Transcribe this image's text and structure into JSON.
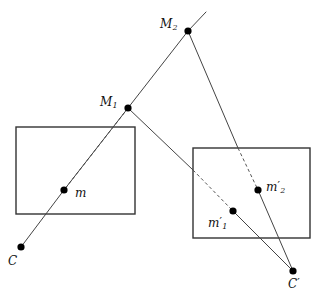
{
  "figure": {
    "type": "geometric-diagram",
    "width": 324,
    "height": 303,
    "background_color": "#ffffff",
    "stroke_color": "#333333",
    "point_color": "#000000",
    "text_color": "#111111"
  },
  "labels": {
    "M1": {
      "base": "M",
      "sub": "1",
      "prime": "",
      "x": 100,
      "y": 96
    },
    "M2": {
      "base": "M",
      "sub": "2",
      "prime": "",
      "x": 160,
      "y": 18
    },
    "m": {
      "base": "m",
      "sub": "",
      "prime": "",
      "x": 75,
      "y": 187
    },
    "m1p": {
      "base": "m",
      "sub": "1",
      "prime": "′",
      "x": 208,
      "y": 216
    },
    "m2p": {
      "base": "m",
      "sub": "2",
      "prime": "′",
      "x": 266,
      "y": 180
    },
    "C": {
      "base": "C",
      "sub": "",
      "prime": "",
      "x": 8,
      "y": 255
    },
    "Cp": {
      "base": "C",
      "sub": "",
      "prime": "′",
      "x": 288,
      "y": 277
    }
  },
  "points": [
    {
      "name": "M1",
      "x": 128,
      "y": 108,
      "r": 3.6
    },
    {
      "name": "M2",
      "x": 188,
      "y": 31,
      "r": 3.6
    },
    {
      "name": "m",
      "x": 64,
      "y": 190,
      "r": 3.6
    },
    {
      "name": "m1-prime",
      "x": 233,
      "y": 211,
      "r": 3.6
    },
    {
      "name": "m2-prime",
      "x": 258,
      "y": 190,
      "r": 3.6
    },
    {
      "name": "C",
      "x": 21,
      "y": 247,
      "r": 3.6
    },
    {
      "name": "C-prime",
      "x": 293,
      "y": 271,
      "r": 3.6
    }
  ],
  "rectangles": [
    {
      "name": "left-image-plane",
      "x": 16,
      "y": 127,
      "width": 119,
      "height": 87
    },
    {
      "name": "right-image-plane",
      "x": 193,
      "y": 148,
      "width": 117,
      "height": 90
    }
  ],
  "solid_segments": [
    {
      "name": "ray-M2-extension",
      "x1": 188,
      "y1": 31,
      "x2": 206,
      "y2": 12
    },
    {
      "name": "ray-M2-to-M1",
      "x1": 188,
      "y1": 31,
      "x2": 128,
      "y2": 108
    },
    {
      "name": "ray-M1-to-m",
      "x1": 128,
      "y1": 108,
      "x2": 64,
      "y2": 190
    },
    {
      "name": "ray-m-to-C",
      "x1": 64,
      "y1": 190,
      "x2": 21,
      "y2": 247
    },
    {
      "name": "ray-M2-to-right-plane",
      "x1": 188,
      "y1": 31,
      "x2": 238,
      "y2": 148
    },
    {
      "name": "ray-M1-to-right-plane",
      "x1": 128,
      "y1": 108,
      "x2": 193,
      "y2": 170
    },
    {
      "name": "ray-m1prime-to-Cprime",
      "x1": 233,
      "y1": 211,
      "x2": 293,
      "y2": 271
    },
    {
      "name": "ray-m2prime-to-Cprime",
      "x1": 258,
      "y1": 190,
      "x2": 293,
      "y2": 271
    }
  ],
  "dashed_segments": [
    {
      "name": "dashed-M1-to-m-through-left-plane",
      "x1": 128,
      "y1": 108,
      "x2": 64,
      "y2": 190
    },
    {
      "name": "dashed-into-right-plane-to-m1prime",
      "x1": 193,
      "y1": 170,
      "x2": 233,
      "y2": 211
    },
    {
      "name": "dashed-M2-into-right-plane-to-m2prime",
      "x1": 238,
      "y1": 148,
      "x2": 258,
      "y2": 190
    }
  ]
}
